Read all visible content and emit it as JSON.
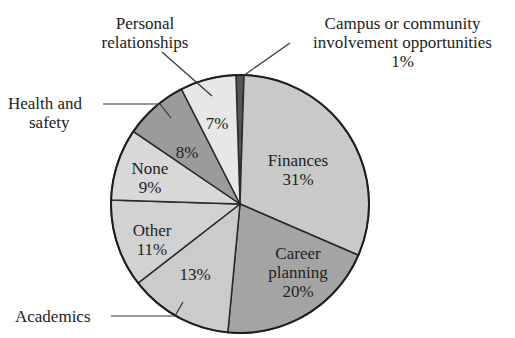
{
  "chart_data": {
    "type": "pie",
    "title": "",
    "start_angle_deg": 0,
    "direction": "clockwise",
    "slices": [
      {
        "label": "Campus or community involvement opportunities",
        "value": 1,
        "color": "#555555"
      },
      {
        "label": "Finances",
        "value": 31,
        "color": "#c9c9c9"
      },
      {
        "label": "Career planning",
        "value": 20,
        "color": "#a4a4a4"
      },
      {
        "label": "Academics",
        "value": 13,
        "color": "#cbcbcb"
      },
      {
        "label": "Other",
        "value": 11,
        "color": "#d2d2d2"
      },
      {
        "label": "None",
        "value": 9,
        "color": "#d8d8d8"
      },
      {
        "label": "Health and safety",
        "value": 8,
        "color": "#9b9b9b"
      },
      {
        "label": "Personal relationships",
        "value": 7,
        "color": "#e7e7e7"
      }
    ]
  },
  "labels": {
    "campus_line1": "Campus or community",
    "campus_line2": "involvement opportunities",
    "campus_pct": "1%",
    "finances": "Finances",
    "finances_pct": "31%",
    "career_line1": "Career",
    "career_line2": "planning",
    "career_pct": "20%",
    "academics": "Academics",
    "academics_pct": "13%",
    "other": "Other",
    "other_pct": "11%",
    "none": "None",
    "none_pct": "9%",
    "health_line1": "Health and",
    "health_line2": "safety",
    "health_pct": "8%",
    "personal_line1": "Personal",
    "personal_line2": "relationships",
    "personal_pct": "7%"
  }
}
